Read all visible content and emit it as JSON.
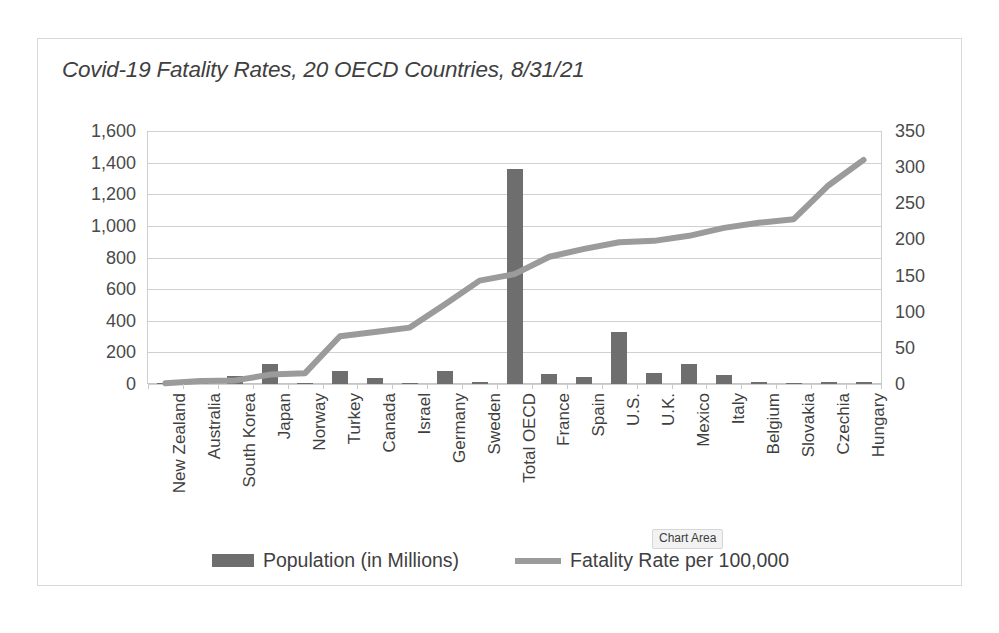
{
  "chart_data": {
    "type": "bar",
    "title": "Covid-19 Fatality Rates, 20 OECD Countries, 8/31/21",
    "xlabel": "",
    "ylabel": "",
    "grid": true,
    "legend_position": "bottom",
    "categories": [
      "New Zealand",
      "Australia",
      "South Korea",
      "Japan",
      "Norway",
      "Turkey",
      "Canada",
      "Israel",
      "Germany",
      "Sweden",
      "Total OECD",
      "France",
      "Spain",
      "U.S.",
      "U.K.",
      "Mexico",
      "Italy",
      "Belgium",
      "Slovakia",
      "Czechia",
      "Hungary"
    ],
    "series": [
      {
        "name": "Population (in Millions)",
        "type": "bar",
        "axis": "left",
        "color": "#6e6e6e",
        "ylim": [
          0,
          1600
        ],
        "ytick_labels": [
          "1,600",
          "1,400",
          "1,200",
          "1,000",
          "800",
          "600",
          "400",
          "200",
          "0"
        ],
        "ytick_values": [
          1600,
          1400,
          1200,
          1000,
          800,
          600,
          400,
          200,
          0
        ],
        "values": [
          5,
          26,
          52,
          126,
          5,
          85,
          38,
          9,
          84,
          10,
          1360,
          65,
          47,
          330,
          67,
          128,
          60,
          12,
          5,
          11,
          10
        ]
      },
      {
        "name": "Fatality Rate per 100,000",
        "type": "line",
        "axis": "right",
        "color": "#9b9b9b",
        "ylim": [
          0,
          350
        ],
        "ytick_labels": [
          "350",
          "300",
          "250",
          "200",
          "150",
          "100",
          "50",
          "0"
        ],
        "ytick_values": [
          350,
          300,
          250,
          200,
          150,
          100,
          50,
          0
        ],
        "values": [
          1,
          4,
          5,
          13,
          15,
          66,
          72,
          78,
          110,
          143,
          152,
          176,
          187,
          196,
          198,
          205,
          216,
          223,
          228,
          275,
          310
        ]
      }
    ]
  },
  "legend": {
    "items": [
      {
        "label": "Population (in Millions)",
        "marker": "bar-swatch"
      },
      {
        "label": "Fatality Rate per 100,000",
        "marker": "line-swatch"
      }
    ]
  },
  "tooltip": {
    "label": "Chart Area"
  },
  "colors": {
    "bar": "#6e6e6e",
    "line": "#9b9b9b",
    "gridline": "#d0d0d0",
    "text": "#3f3f3f",
    "frame_border": "#d9d9d9"
  }
}
